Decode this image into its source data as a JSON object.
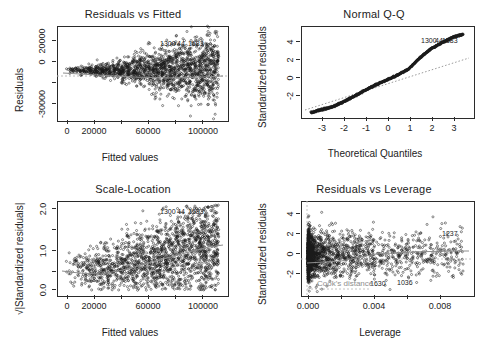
{
  "figure": {
    "background": "#ffffff",
    "ink": "#1a1a1a",
    "reference_line_color": "#b0b0b0",
    "smoother_color": "#8e8e8e",
    "layout": "2x2 grid of regression diagnostic plots"
  },
  "panels": [
    {
      "id": "residuals-vs-fitted",
      "title": "Residuals vs Fitted",
      "xlabel": "Fitted values",
      "ylabel": "Residuals",
      "xticks": [
        "0",
        "20000",
        "60000",
        "100000"
      ],
      "xtick_values": [
        0,
        20000,
        60000,
        100000
      ],
      "yticks": [
        "-30000",
        "0",
        "20000"
      ],
      "ytick_values": [
        -30000,
        0,
        20000
      ],
      "xlim": [
        -12000,
        112000
      ],
      "ylim": [
        -34000,
        30000
      ],
      "point_labels": [
        "1300",
        "44",
        "1583"
      ],
      "has_zero_reference_line": true,
      "has_smoother": true
    },
    {
      "id": "normal-qq",
      "title": "Normal Q-Q",
      "xlabel": "Theoretical Quantiles",
      "ylabel": "Standardized residuals",
      "xticks": [
        "-3",
        "-2",
        "-1",
        "0",
        "1",
        "2",
        "3"
      ],
      "xtick_values": [
        -3,
        -2,
        -1,
        0,
        1,
        2,
        3
      ],
      "yticks": [
        "-2",
        "0",
        "2",
        "4"
      ],
      "ytick_values": [
        -2,
        0,
        2,
        4
      ],
      "xlim": [
        -3.9,
        3.9
      ],
      "ylim": [
        -3.4,
        4.8
      ],
      "point_labels": [
        "1300",
        "44",
        "1583"
      ],
      "has_reference_line": true,
      "reference_line_style": "dotted"
    },
    {
      "id": "scale-location",
      "title": "Scale-Location",
      "xlabel": "Fitted values",
      "ylabel": "√|Standardized residuals|",
      "xticks": [
        "0",
        "20000",
        "60000",
        "100000"
      ],
      "xtick_values": [
        0,
        20000,
        60000,
        100000
      ],
      "yticks": [
        "0.0",
        "1.0",
        "2.0"
      ],
      "ytick_values": [
        0.0,
        1.0,
        2.0
      ],
      "xlim": [
        -12000,
        112000
      ],
      "ylim": [
        -0.12,
        2.25
      ],
      "point_labels": [
        "1300",
        "44",
        "1583"
      ],
      "has_smoother": true
    },
    {
      "id": "residuals-vs-leverage",
      "title": "Residuals vs Leverage",
      "xlabel": "Leverage",
      "ylabel": "Standardized residuals",
      "xticks": [
        "0.000",
        "0.004",
        "0.008"
      ],
      "xtick_values": [
        0.0,
        0.004,
        0.008
      ],
      "yticks": [
        "-2",
        "0",
        "2",
        "4"
      ],
      "ytick_values": [
        -2,
        0,
        2,
        4
      ],
      "xlim": [
        -0.0004,
        0.0104
      ],
      "ylim": [
        -3.6,
        4.9
      ],
      "point_labels": [
        "1237",
        "1630",
        "1036"
      ],
      "annotation": "Cook's distance",
      "has_zero_reference_line": true,
      "has_smoother": true
    }
  ],
  "chart_data": {
    "type": "scatter",
    "panels": [
      {
        "type": "scatter",
        "title": "Residuals vs Fitted",
        "xlabel": "Fitted values",
        "ylabel": "Residuals",
        "xlim": [
          -12000,
          112000
        ],
        "ylim": [
          -34000,
          30000
        ],
        "xticks": [
          0,
          20000,
          60000,
          100000
        ],
        "yticks": [
          -30000,
          0,
          20000
        ],
        "grid": false,
        "legend": "none",
        "description": "Heteroscedastic fan: residual spread narrow near low fitted values and widening strongly above 60000.",
        "annotations": [
          {
            "text": "1300",
            "x": 62000,
            "y": 26500
          },
          {
            "text": "44",
            "x": 71000,
            "y": 26500
          },
          {
            "text": "1583",
            "x": 80000,
            "y": 26500
          }
        ],
        "reference_lines": [
          {
            "type": "horizontal",
            "y": 0,
            "style": "dotted"
          }
        ],
        "spread_profile": [
          {
            "x": 0,
            "halfwidth": 2200
          },
          {
            "x": 20000,
            "halfwidth": 4200
          },
          {
            "x": 40000,
            "halfwidth": 8000
          },
          {
            "x": 60000,
            "halfwidth": 14000
          },
          {
            "x": 80000,
            "halfwidth": 20000
          },
          {
            "x": 100000,
            "halfwidth": 23000
          }
        ]
      },
      {
        "type": "scatter",
        "title": "Normal Q-Q",
        "xlabel": "Theoretical Quantiles",
        "ylabel": "Standardized residuals",
        "xlim": [
          -3.9,
          3.9
        ],
        "ylim": [
          -3.4,
          4.8
        ],
        "xticks": [
          -3,
          -2,
          -1,
          0,
          1,
          2,
          3
        ],
        "yticks": [
          -2,
          0,
          2,
          4
        ],
        "grid": false,
        "legend": "none",
        "description": "S-shaped quantile curve lying above the dotted 1:1 reference at both tails, indicating heavy tails.",
        "annotations": [
          {
            "text": "1300",
            "x": 2.75,
            "y": 4.05
          },
          {
            "text": "44",
            "x": 3.0,
            "y": 4.05
          },
          {
            "text": "1583",
            "x": 3.2,
            "y": 4.05
          }
        ],
        "reference_lines": [
          {
            "type": "qq-line",
            "style": "dotted"
          }
        ],
        "curve": [
          {
            "x": -3.5,
            "y": -3.05
          },
          {
            "x": -3.0,
            "y": -2.75
          },
          {
            "x": -2.5,
            "y": -2.5
          },
          {
            "x": -2.0,
            "y": -2.05
          },
          {
            "x": -1.5,
            "y": -1.55
          },
          {
            "x": -1.0,
            "y": -1.0
          },
          {
            "x": -0.5,
            "y": -0.5
          },
          {
            "x": 0.0,
            "y": -0.05
          },
          {
            "x": 0.5,
            "y": 0.4
          },
          {
            "x": 1.0,
            "y": 0.95
          },
          {
            "x": 1.5,
            "y": 1.95
          },
          {
            "x": 2.0,
            "y": 2.75
          },
          {
            "x": 2.5,
            "y": 3.3
          },
          {
            "x": 3.0,
            "y": 3.8
          },
          {
            "x": 3.5,
            "y": 4.1
          }
        ]
      },
      {
        "type": "scatter",
        "title": "Scale-Location",
        "xlabel": "Fitted values",
        "ylabel": "√|Standardized residuals|",
        "xlim": [
          -12000,
          112000
        ],
        "ylim": [
          -0.12,
          2.25
        ],
        "xticks": [
          0,
          20000,
          60000,
          100000
        ],
        "yticks": [
          0.0,
          1.0,
          2.0
        ],
        "grid": false,
        "legend": "none",
        "description": "Cloud dipping near 25000 then rising; loess smoother trends upward from about 0.55 to 1.15.",
        "annotations": [
          {
            "text": "1300",
            "x": 62000,
            "y": 2.03
          },
          {
            "text": "44",
            "x": 71000,
            "y": 2.03
          },
          {
            "text": "1583",
            "x": 80000,
            "y": 2.03
          }
        ],
        "smoother": [
          {
            "x": -6000,
            "y": 0.6
          },
          {
            "x": 5000,
            "y": 0.55
          },
          {
            "x": 20000,
            "y": 0.52
          },
          {
            "x": 35000,
            "y": 0.6
          },
          {
            "x": 50000,
            "y": 0.72
          },
          {
            "x": 65000,
            "y": 0.85
          },
          {
            "x": 80000,
            "y": 0.98
          },
          {
            "x": 95000,
            "y": 1.1
          },
          {
            "x": 106000,
            "y": 1.15
          }
        ]
      },
      {
        "type": "scatter",
        "title": "Residuals vs Leverage",
        "xlabel": "Leverage",
        "ylabel": "Standardized residuals",
        "xlim": [
          -0.0004,
          0.0104
        ],
        "ylim": [
          -3.6,
          4.9
        ],
        "xticks": [
          0.0,
          0.004,
          0.008
        ],
        "yticks": [
          -2,
          0,
          2,
          4
        ],
        "grid": false,
        "legend": "none",
        "description": "Very dense mass of points at low leverage below 0.002 thinning out to isolated high-leverage points near 0.009.",
        "annotations": [
          {
            "text": "Cook's distance",
            "x": 0.0022,
            "y": -3.15
          },
          {
            "text": "1237",
            "x": 0.0088,
            "y": 1.45
          },
          {
            "text": "1630",
            "x": 0.0053,
            "y": -3.05
          },
          {
            "text": "1036",
            "x": 0.0069,
            "y": -3.0
          }
        ],
        "reference_lines": [
          {
            "type": "horizontal",
            "y": 0,
            "style": "dotted"
          }
        ]
      }
    ]
  }
}
